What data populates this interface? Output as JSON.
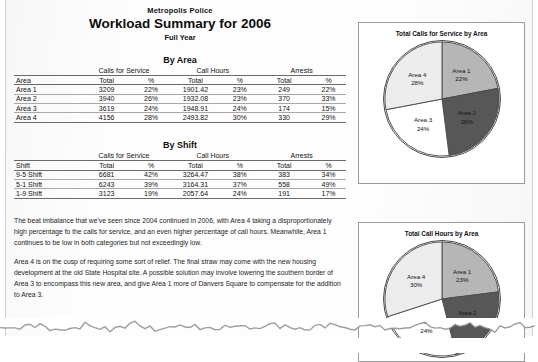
{
  "document": {
    "organization": "Metropolis Police",
    "title": "Workload Summary for 2006",
    "subtitle": "Full Year"
  },
  "by_area": {
    "section_title": "By Area",
    "group_headers": [
      "",
      "Calls for Service",
      "Call Hours",
      "Arrests"
    ],
    "column_headers": [
      "Area",
      "Total",
      "%",
      "Total",
      "%",
      "Total",
      "%"
    ],
    "rows": [
      {
        "label": "Area 1",
        "calls_total": "3209",
        "calls_pct": "22%",
        "hours_total": "1901.42",
        "hours_pct": "23%",
        "arrests_total": "249",
        "arrests_pct": "22%"
      },
      {
        "label": "Area 2",
        "calls_total": "3940",
        "calls_pct": "26%",
        "hours_total": "1932.08",
        "hours_pct": "23%",
        "arrests_total": "370",
        "arrests_pct": "33%"
      },
      {
        "label": "Area 3",
        "calls_total": "3619",
        "calls_pct": "24%",
        "hours_total": "1948.91",
        "hours_pct": "24%",
        "arrests_total": "174",
        "arrests_pct": "15%"
      },
      {
        "label": "Area 4",
        "calls_total": "4156",
        "calls_pct": "28%",
        "hours_total": "2493.82",
        "hours_pct": "30%",
        "arrests_total": "330",
        "arrests_pct": "29%"
      }
    ]
  },
  "by_shift": {
    "section_title": "By Shift",
    "group_headers": [
      "",
      "Calls for Service",
      "Call Hours",
      "Arrests"
    ],
    "column_headers": [
      "Shift",
      "Total",
      "%",
      "Total",
      "%",
      "Total",
      "%"
    ],
    "rows": [
      {
        "label": "9-5 Shift",
        "calls_total": "6681",
        "calls_pct": "42%",
        "hours_total": "3264.47",
        "hours_pct": "38%",
        "arrests_total": "383",
        "arrests_pct": "34%"
      },
      {
        "label": "5-1 Shift",
        "calls_total": "6243",
        "calls_pct": "39%",
        "hours_total": "3164.31",
        "hours_pct": "37%",
        "arrests_total": "558",
        "arrests_pct": "49%"
      },
      {
        "label": "1-9 Shift",
        "calls_total": "3123",
        "calls_pct": "19%",
        "hours_total": "2057.64",
        "hours_pct": "24%",
        "arrests_total": "191",
        "arrests_pct": "17%"
      }
    ]
  },
  "notes": {
    "paragraph_1": "The beat imbalance that we've seen since 2004 continued in 2006, with Area 4 taking a disproportionately high percentage fo the calls for service, and an even higher percentage of call hours. Meanwhile, Area 1 continues to be low in both categories but not exceedingly low.",
    "paragraph_2": "Area 4 is on the cusp of requiring some sort of relief. The final straw may come with the new housing development at the old State Hospital site. A possible solution may involve lowering the southern border of Area 3 to encompass this new area, and give Area 1 more of Danvers Square to compensate for the addition to Area 3."
  },
  "chart_data": [
    {
      "id": "calls-by-area",
      "type": "pie",
      "title": "Total Calls for Service by Area",
      "labels": [
        "Area 1",
        "Area 2",
        "Area 3",
        "Area 4"
      ],
      "values": [
        22,
        26,
        24,
        28
      ],
      "value_labels": [
        "22%",
        "26%",
        "24%",
        "28%"
      ],
      "colors": [
        "#b6b6b6",
        "#575757",
        "#ffffff",
        "#ececec"
      ],
      "start_angle_deg": 0,
      "direction": "clockwise",
      "legend": "none",
      "labels_inside": true
    },
    {
      "id": "hours-by-area",
      "type": "pie",
      "title": "Total Call Hours by Area",
      "labels": [
        "Area 1",
        "Area 2",
        "Area 3",
        "Area 4"
      ],
      "values": [
        23,
        23,
        24,
        30
      ],
      "value_labels": [
        "23%",
        "23%",
        "24%",
        "30%"
      ],
      "colors": [
        "#b6b6b6",
        "#575757",
        "#ffffff",
        "#ececec"
      ],
      "start_angle_deg": 0,
      "direction": "clockwise",
      "legend": "none",
      "labels_inside": true
    }
  ]
}
